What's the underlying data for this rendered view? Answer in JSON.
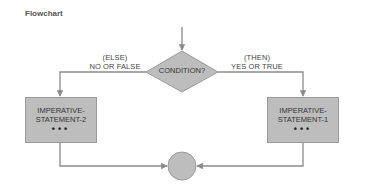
{
  "title": "Flowchart",
  "diagram": {
    "decision": {
      "label": "CONDITION?"
    },
    "else_branch": {
      "line1": "(ELSE)",
      "line2": "NO OR FALSE"
    },
    "then_branch": {
      "line1": "(THEN)",
      "line2": "YES OR TRUE"
    },
    "left_box": {
      "line1": "IMPERATIVE-",
      "line2": "STATEMENT-2",
      "dots": "•••"
    },
    "right_box": {
      "line1": "IMPERATIVE-",
      "line2": "STATEMENT-1",
      "dots": "•••"
    },
    "connector": {
      "shape": "circle"
    },
    "colors": {
      "fill": "#bdbdbd",
      "line": "#8a8a8a",
      "text": "#333333"
    }
  }
}
